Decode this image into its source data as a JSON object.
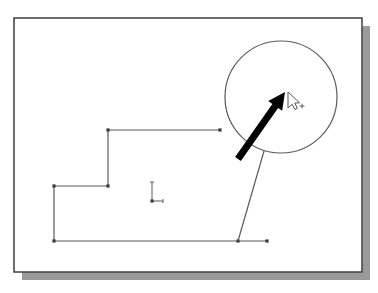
{
  "app": {
    "title": "CAD Drawing Canvas",
    "background_color": "#ffffff"
  },
  "page": {
    "label": "drawing-sheet",
    "fill_color": "#ffffff",
    "border_color": "#4a4a4a",
    "shadow_color": "#9a9a9a",
    "x": 14,
    "y": 18,
    "width": 348,
    "height": 254,
    "shadow_offset_x": 8,
    "shadow_offset_y": 8
  },
  "geometry": {
    "line_color": "#5a5a5a",
    "vertex_color": "#3a3a3a",
    "stroke_width": 1.2,
    "profile": {
      "name": "step-profile-polyline",
      "points": [
        {
          "x": 108,
          "y": 130
        },
        {
          "x": 220,
          "y": 130
        },
        {
          "x": 108,
          "y": 186
        },
        {
          "x": 54,
          "y": 186
        },
        {
          "x": 54,
          "y": 241
        },
        {
          "x": 267,
          "y": 241
        }
      ],
      "segments": [
        {
          "name": "upper-horizontal-segment",
          "x1": 108,
          "y1": 130,
          "x2": 220,
          "y2": 130
        },
        {
          "name": "upper-vertical-segment",
          "x1": 108,
          "y1": 130,
          "x2": 108,
          "y2": 186
        },
        {
          "name": "middle-horizontal-segment",
          "x1": 54,
          "y1": 186,
          "x2": 108,
          "y2": 186
        },
        {
          "name": "left-vertical-segment",
          "x1": 54,
          "y1": 186,
          "x2": 54,
          "y2": 241
        },
        {
          "name": "bottom-horizontal-segment",
          "x1": 54,
          "y1": 241,
          "x2": 267,
          "y2": 241
        }
      ],
      "vertex_markers": [
        {
          "x": 108,
          "y": 130
        },
        {
          "x": 220,
          "y": 130
        },
        {
          "x": 108,
          "y": 186
        },
        {
          "x": 54,
          "y": 186
        },
        {
          "x": 54,
          "y": 241
        },
        {
          "x": 238,
          "y": 241
        },
        {
          "x": 267,
          "y": 241
        }
      ],
      "vertex_size": 3.2
    },
    "circle": {
      "name": "circle-entity",
      "cx": 281,
      "cy": 97,
      "r": 56
    },
    "leader_line": {
      "name": "leader-line",
      "x1": 264,
      "y1": 151,
      "x2": 238,
      "y2": 241
    },
    "origin_marker": {
      "name": "origin-axes-marker",
      "x": 152,
      "y": 201,
      "y_axis_length": 19,
      "x_axis_length": 11
    }
  },
  "annotations": {
    "pointer_arrow": {
      "name": "emphasis-arrow",
      "color": "#000000",
      "tail_x": 238,
      "tail_y": 159,
      "head_x": 285,
      "head_y": 92,
      "shaft_width": 7,
      "head_length": 17,
      "head_width": 17
    }
  },
  "cursor": {
    "name": "mouse-pointer",
    "x": 288,
    "y": 92,
    "fill_color": "#ffffff",
    "outline_color": "#555555",
    "crosshair": {
      "name": "snap-crosshair",
      "x": 302,
      "y": 106,
      "size": 2.4,
      "color": "#5a5a5a"
    }
  }
}
